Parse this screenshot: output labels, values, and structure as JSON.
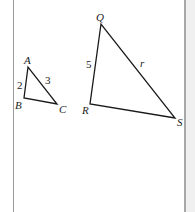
{
  "diagram": {
    "colors": {
      "stroke": "#1a1a1a",
      "frame": "#9a9a9a",
      "gutter": "#f0f0f0"
    },
    "triangle_small": {
      "vertices": {
        "A": "A",
        "B": "B",
        "C": "C"
      },
      "side_AB": "2",
      "side_AC": "3"
    },
    "triangle_large": {
      "vertices": {
        "Q": "Q",
        "R": "R",
        "S": "S"
      },
      "side_QR": "5",
      "side_QS": "r"
    }
  }
}
